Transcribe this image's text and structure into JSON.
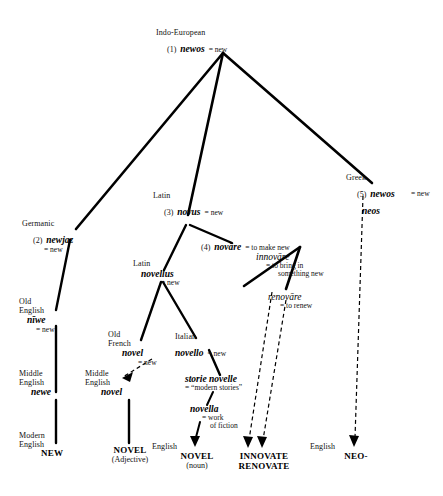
{
  "diagram": {
    "line_color": "#000000"
  },
  "nodes": {
    "indo_european": {
      "lang": "Indo-European",
      "num": "(1)",
      "form": "newos",
      "gloss": "= new"
    },
    "germanic": {
      "lang": "Germanic",
      "num": "(2)",
      "form": "newjaz",
      "gloss": "= new"
    },
    "old_english_niwe": {
      "lang1": "Old",
      "lang2": "English",
      "form": "nīwe",
      "gloss": "= new"
    },
    "middle_english_newe": {
      "lang1": "Middle",
      "lang2": "English",
      "form": "newe"
    },
    "modern_english_new": {
      "lang1": "Modern",
      "lang2": "English",
      "term": "NEW"
    },
    "latin_novus": {
      "lang": "Latin",
      "num": "(3)",
      "form": "novus",
      "gloss": "= new"
    },
    "latin_novare": {
      "num": "(4)",
      "form": "novāre",
      "gloss": "= to make new"
    },
    "innovare": {
      "form": "innovāre",
      "gloss1": "= to bring in",
      "gloss2": "something new"
    },
    "renovare": {
      "form": "renovāre",
      "gloss": "= to renew"
    },
    "latin_novellus": {
      "lang": "Latin",
      "form": "novellus",
      "gloss": "= new"
    },
    "old_french_novel": {
      "lang1": "Old",
      "lang2": "French",
      "form": "novel",
      "gloss": "= new"
    },
    "middle_english_novel": {
      "lang1": "Middle",
      "lang2": "English",
      "form": "novel"
    },
    "italian_novello": {
      "lang": "Italian",
      "form": "novello",
      "gloss": "= new"
    },
    "storie_novelle": {
      "form": "storie novelle",
      "gloss": "= “modern stories”"
    },
    "novella": {
      "form": "novella",
      "gloss1": "= work",
      "gloss2": "of fiction"
    },
    "greek": {
      "lang": "Greek",
      "num": "(5)",
      "form1": "newos",
      "form2": "neos",
      "gloss": "= new"
    },
    "novel_adjective": {
      "term": "NOVEL",
      "sub": "(Adjective)"
    },
    "novel_noun": {
      "lang": "English",
      "term": "NOVEL",
      "sub": "(noun)"
    },
    "innovate_renovate": {
      "term1": "INNOVATE",
      "term2": "RENOVATE"
    },
    "neo": {
      "lang": "English",
      "term": "NEO-"
    }
  }
}
